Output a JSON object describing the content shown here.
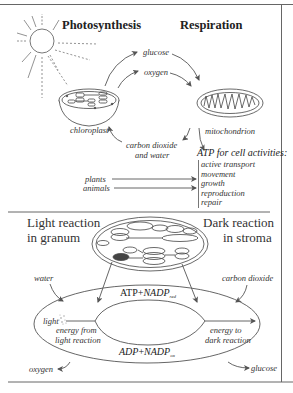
{
  "top_section": {
    "titles": {
      "photosynthesis": "Photosynthesis",
      "respiration": "Respiration"
    },
    "products_to_respiration": [
      "glucose",
      "oxygen"
    ],
    "organelles": {
      "chloroplast": "chloroplast",
      "mitochondrion": "mitochondrion"
    },
    "return_products": {
      "line1": "carbon dioxide",
      "line2": "and water"
    },
    "atp_heading": "ATP for cell activities:",
    "cell_activities": [
      "active transport",
      "movement",
      "growth",
      "reproduction",
      "repair"
    ],
    "organisms": [
      "plants",
      "animals"
    ]
  },
  "bottom_section": {
    "light_reaction": {
      "line1": "Light reaction",
      "line2": "in granum"
    },
    "dark_reaction": {
      "line1": "Dark reaction",
      "line2": "in stroma"
    },
    "inputs": {
      "water": "water",
      "carbon_dioxide": "carbon dioxide",
      "light": "light"
    },
    "outputs": {
      "oxygen": "oxygen",
      "glucose": "glucose"
    },
    "cycle_top": {
      "base": "ATP",
      "plus": "+",
      "nadp": "NADP",
      "subscript": "red"
    },
    "cycle_bottom": {
      "base": "ADP",
      "plus": "+",
      "nadp": "NADP",
      "subscript": "ox"
    },
    "energy_from": {
      "line1": "energy from",
      "line2": "light reaction"
    },
    "energy_to": {
      "line1": "energy to",
      "line2": "dark reaction"
    }
  },
  "colors": {
    "line": "#555555",
    "text": "#222222",
    "granum_dark": "#444444"
  }
}
